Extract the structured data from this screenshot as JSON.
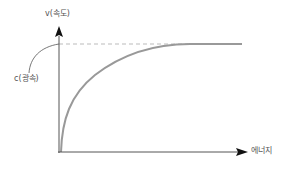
{
  "diagram": {
    "y_axis_label": "v(속도)",
    "x_axis_label": "에너지",
    "asymptote_label": "c(광속)",
    "colors": {
      "axis": "#333333",
      "curve": "#999999",
      "dashed": "#bbbbbb",
      "label": "#555555",
      "background": "#ffffff"
    }
  }
}
